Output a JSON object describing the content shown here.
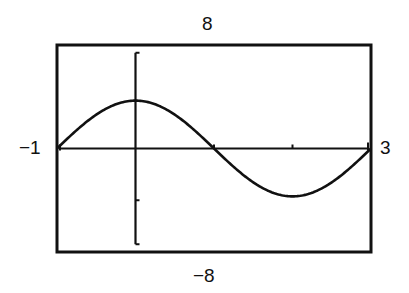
{
  "chart_data": {
    "type": "line",
    "title": "",
    "xlabel": "",
    "ylabel": "",
    "xlim": [
      -1,
      3
    ],
    "ylim": [
      -8,
      8
    ],
    "window_labels": {
      "ymax": "8",
      "ymin": "−8",
      "xmin": "−1",
      "xmax": "3"
    },
    "x_ticks": [
      0,
      1,
      2
    ],
    "y_ticks": [
      -4,
      4
    ],
    "grid": false,
    "legend": null,
    "series": [
      {
        "name": "y = 3.7 sin(π(x+1)/2)",
        "amplitude": 3.7,
        "period": 4,
        "x": [
          -1,
          -0.5,
          0,
          0.5,
          1,
          1.5,
          2,
          2.5,
          3
        ],
        "y": [
          0,
          2.6,
          3.7,
          2.6,
          0,
          -2.6,
          -3.7,
          -2.6,
          0
        ]
      }
    ]
  },
  "colors": {
    "ink": "#111111",
    "background": "#ffffff"
  }
}
